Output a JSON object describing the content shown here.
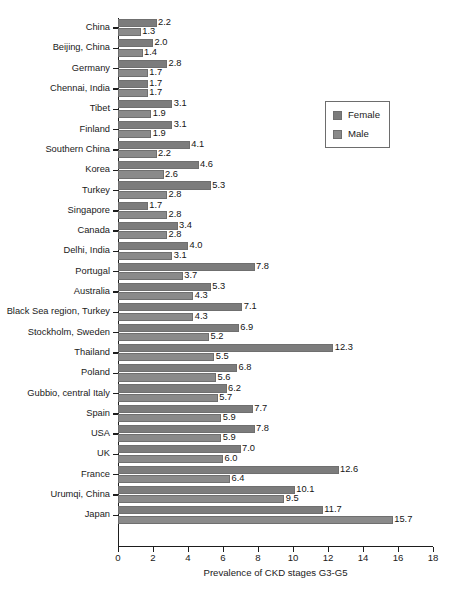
{
  "chart_data": {
    "type": "bar",
    "orientation": "horizontal",
    "title": "",
    "xlabel": "Prevalence of CKD stages G3-G5",
    "ylabel": "",
    "xlim": [
      0,
      18
    ],
    "xticks": [
      0,
      2,
      4,
      6,
      8,
      10,
      12,
      14,
      16,
      18
    ],
    "grid": false,
    "legend_position": "upper right",
    "categories": [
      "China",
      "Beijing, China",
      "Germany",
      "Chennai, India",
      "Tibet",
      "Finland",
      "Southern China",
      "Korea",
      "Turkey",
      "Singapore",
      "Canada",
      "Delhi, India",
      "Portugal",
      "Australia",
      "Black Sea region, Turkey",
      "Stockholm, Sweden",
      "Thailand",
      "Poland",
      "Gubbio, central Italy",
      "Spain",
      "USA",
      "UK",
      "France",
      "Urumqi, China",
      "Japan"
    ],
    "series": [
      {
        "name": "Female",
        "color": "#7c7c7c",
        "values": [
          2.2,
          2.0,
          2.8,
          1.7,
          3.1,
          3.1,
          4.1,
          4.6,
          5.3,
          1.7,
          3.4,
          4.0,
          7.8,
          5.3,
          7.1,
          6.9,
          12.3,
          6.8,
          6.2,
          7.7,
          7.8,
          7.0,
          12.6,
          10.1,
          11.7
        ],
        "labels": [
          "2.2",
          "2.0",
          "2.8",
          "1.7",
          "3.1",
          "3.1",
          "4.1",
          "4.6",
          "5.3",
          "1.7",
          "3.4",
          "4.0",
          "7.8",
          "5.3",
          "7.1",
          "6.9",
          "12.3",
          "6.8",
          "6.2",
          "7.7",
          "7.8",
          "7.0",
          "12.6",
          "10.1",
          "11.7"
        ]
      },
      {
        "name": "Male",
        "color": "#8a8a8a",
        "values": [
          1.3,
          1.4,
          1.7,
          1.7,
          1.9,
          1.9,
          2.2,
          2.6,
          2.8,
          2.8,
          2.8,
          3.1,
          3.7,
          4.3,
          4.3,
          5.2,
          5.5,
          5.6,
          5.7,
          5.9,
          5.9,
          6.0,
          6.4,
          9.5,
          15.7
        ],
        "labels": [
          "1.3",
          "1.4",
          "1.7",
          "1.7",
          "1.9",
          "1.9",
          "2.2",
          "2.6",
          "2.8",
          "2.8",
          "2.8",
          "3.1",
          "3.7",
          "4.3",
          "4.3",
          "5.2",
          "5.5",
          "5.6",
          "5.7",
          "5.9",
          "5.9",
          "6.0",
          "6.4",
          "9.5",
          "15.7"
        ]
      }
    ]
  },
  "legend": {
    "entries": [
      {
        "label": "Female"
      },
      {
        "label": "Male"
      }
    ]
  },
  "axis": {
    "x_title": "Prevalence of CKD stages G3-G5"
  },
  "caption": {
    "text": ""
  }
}
